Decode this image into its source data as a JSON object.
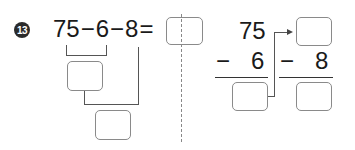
{
  "problem": {
    "number": "13",
    "expression": {
      "a": "75",
      "op1": "−",
      "b": "6",
      "op2": "−",
      "c": "8",
      "equals": "="
    },
    "vertical": {
      "top": "75",
      "minus1": "−",
      "sub1": "6",
      "minus2": "−",
      "sub2": "8"
    },
    "answer_boxes": [
      "",
      "",
      "",
      "",
      "",
      ""
    ]
  }
}
